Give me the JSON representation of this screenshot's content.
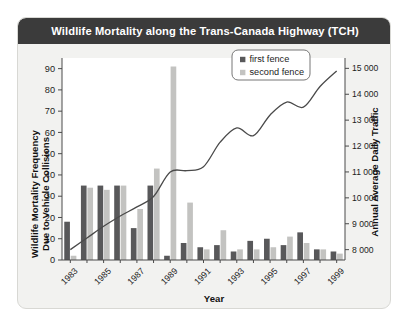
{
  "chart_data": {
    "type": "bar",
    "title": "Wildlife Mortality along the Trans-Canada Highway (TCH)",
    "xlabel": "Year",
    "ylabel": "Wildlife Mortality Frequency\nDue to Vehicle Collisions",
    "ylabel_line1": "Wildlife Mortality Frequency",
    "ylabel_line2": "Due to Vehicle Collisions",
    "y2label": "Annual Average Daily Traffic",
    "grid": false,
    "legend_position": "top-right",
    "categories": [
      1983,
      1984,
      1985,
      1986,
      1987,
      1988,
      1989,
      1990,
      1991,
      1992,
      1993,
      1994,
      1995,
      1996,
      1997,
      1998,
      1999
    ],
    "x_tick_labels": [
      "1983",
      "",
      "1985",
      "",
      "1987",
      "",
      "1989",
      "",
      "1991",
      "",
      "1993",
      "",
      "1995",
      "",
      "1997",
      "",
      "1999"
    ],
    "ylim": [
      0,
      95
    ],
    "y_ticks": [
      0,
      10,
      20,
      30,
      40,
      50,
      60,
      70,
      80,
      90
    ],
    "y_tick_labels": [
      "0",
      "10",
      "20",
      "30",
      "40",
      "50",
      "60",
      "70",
      "80",
      "90"
    ],
    "y2lim": [
      7600,
      15400
    ],
    "y2_ticks": [
      8000,
      9000,
      10000,
      11000,
      12000,
      13000,
      14000,
      15000
    ],
    "y2_tick_labels": [
      "8 000",
      "9 000",
      "10 000",
      "11 000",
      "12 000",
      "13 000",
      "14 000",
      "15 000"
    ],
    "series": [
      {
        "name": "first fence",
        "type": "bar",
        "color": "#58585a",
        "values": [
          18,
          35,
          35,
          35,
          15,
          35,
          2,
          8,
          6,
          7,
          4,
          9,
          10,
          7,
          13,
          5,
          4
        ]
      },
      {
        "name": "second fence",
        "type": "bar",
        "color": "#c3c3c1",
        "values": [
          2,
          34,
          33,
          35,
          24,
          43,
          91,
          27,
          5,
          14,
          5,
          5,
          6,
          11,
          8,
          5,
          3
        ]
      },
      {
        "name": "Annual Average Daily Traffic",
        "type": "line",
        "color": "#4a4a4a",
        "values": [
          8000,
          8450,
          8900,
          9300,
          9650,
          10050,
          11000,
          11050,
          11200,
          12150,
          12700,
          12400,
          13200,
          13700,
          13500,
          14300,
          14900
        ]
      }
    ],
    "legend": [
      {
        "label": "first fence",
        "color": "#58585a"
      },
      {
        "label": "second fence",
        "color": "#c3c3c1"
      }
    ]
  },
  "colors": {
    "header_bg": "#3b3b3b",
    "header_text": "#ffffff",
    "panel_bg": "#f2f2f0",
    "plot_bg": "#ffffff",
    "axis": "#4a4a4a"
  }
}
